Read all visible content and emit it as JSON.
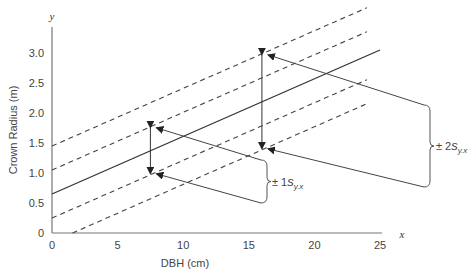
{
  "chart_data": {
    "type": "line",
    "title": "",
    "xlabel": "DBH (cm)",
    "ylabel": "Crown Radius (m)",
    "x_axis_var": "x",
    "y_axis_var": "y",
    "xlim": [
      0,
      25
    ],
    "ylim": [
      0,
      3.3
    ],
    "x_ticks": [
      0,
      5,
      10,
      15,
      20,
      25
    ],
    "x_tick_labels": [
      "0",
      "5",
      "10",
      "15",
      "20",
      "25"
    ],
    "y_ticks": [
      0,
      0.5,
      1.0,
      1.5,
      2.0,
      2.5,
      3.0
    ],
    "y_tick_labels": [
      "0",
      "0.5",
      "1.0",
      "1.5",
      "2.0",
      "2.5",
      "3.0"
    ],
    "grid": false,
    "regression": {
      "intercept": 0.65,
      "slope": 0.096,
      "x_range": [
        0,
        25
      ]
    },
    "s_yx": 0.4,
    "series": [
      {
        "name": "regression line",
        "style": "solid",
        "offset_sd": 0,
        "x_range": [
          0,
          25
        ]
      },
      {
        "name": "+1 s_y.x",
        "style": "dashed",
        "offset_sd": 1,
        "x_range": [
          0,
          24
        ]
      },
      {
        "name": "-1 s_y.x",
        "style": "dashed",
        "offset_sd": -1,
        "x_range": [
          0,
          24
        ]
      },
      {
        "name": "+2 s_y.x",
        "style": "dashed",
        "offset_sd": 2,
        "x_range": [
          0,
          24
        ]
      },
      {
        "name": "-2 s_y.x",
        "style": "dashed",
        "offset_sd": -2,
        "x_range": [
          1.5,
          24
        ]
      }
    ],
    "annotations": [
      {
        "label_prefix": "±",
        "label_num": "1",
        "label_s": "s",
        "label_sub": "y.x",
        "at_x": 7.5,
        "sd": 1
      },
      {
        "label_prefix": "±",
        "label_num": "2",
        "label_s": "s",
        "label_sub": "y.x",
        "at_x": 16,
        "sd": 2
      }
    ]
  }
}
